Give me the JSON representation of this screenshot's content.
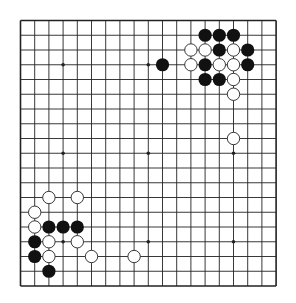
{
  "board": {
    "size": 19,
    "origin": {
      "x": 20.5,
      "y": 20.5
    },
    "spacing": {
      "x": 14.2,
      "y": 14.75
    },
    "line_color": "#222222",
    "background": "#ffffff",
    "star_points": [
      [
        3,
        3
      ],
      [
        9,
        3
      ],
      [
        15,
        3
      ],
      [
        3,
        9
      ],
      [
        9,
        9
      ],
      [
        15,
        9
      ],
      [
        3,
        15
      ],
      [
        9,
        15
      ],
      [
        15,
        15
      ]
    ],
    "stones": {
      "black": [
        [
          13,
          1
        ],
        [
          14,
          1
        ],
        [
          15,
          1
        ],
        [
          14,
          2
        ],
        [
          16,
          2
        ],
        [
          10,
          3
        ],
        [
          13,
          3
        ],
        [
          16,
          3
        ],
        [
          13,
          4
        ],
        [
          14,
          4
        ],
        [
          2,
          14
        ],
        [
          3,
          14
        ],
        [
          4,
          14
        ],
        [
          1,
          15
        ],
        [
          1,
          16
        ],
        [
          2,
          17
        ]
      ],
      "white": [
        [
          12,
          2
        ],
        [
          13,
          2
        ],
        [
          15,
          2
        ],
        [
          12,
          3
        ],
        [
          14,
          3
        ],
        [
          15,
          3
        ],
        [
          15,
          4
        ],
        [
          15,
          5
        ],
        [
          15,
          8
        ],
        [
          2,
          12
        ],
        [
          4,
          12
        ],
        [
          1,
          13
        ],
        [
          1,
          14
        ],
        [
          2,
          15
        ],
        [
          4,
          15
        ],
        [
          2,
          16
        ],
        [
          5,
          16
        ],
        [
          8,
          16
        ]
      ]
    },
    "colors": {
      "black_stone": "#111111",
      "white_stone": "#ffffff",
      "white_stroke": "#222222"
    }
  }
}
